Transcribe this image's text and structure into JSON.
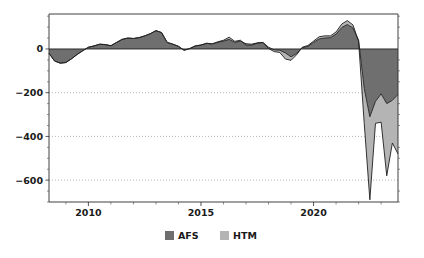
{
  "chart_data": {
    "type": "area",
    "stacked": true,
    "title": "",
    "subtitle": "",
    "xlabel": "",
    "ylabel": "",
    "xlim": [
      2008.25,
      2023.75
    ],
    "ylim": [
      -700,
      160
    ],
    "yticks": [
      0,
      -200,
      -400,
      -600
    ],
    "ytick_labels": [
      "0",
      "−200",
      "−400",
      "−600"
    ],
    "xticks": [
      2010,
      2015,
      2020
    ],
    "xtick_labels": [
      "2010",
      "2015",
      "2020"
    ],
    "xminor_ticks": [
      2009,
      2011,
      2012,
      2013,
      2014,
      2016,
      2017,
      2018,
      2019,
      2021,
      2022,
      2023
    ],
    "grid": "y-dotted",
    "legend_position": "bottom-center",
    "colors": {
      "afs": "#6f6f6f",
      "htm": "#b4b4b4",
      "outline": "#1f1f1f",
      "axis": "#2a2a2a",
      "grid": "#9a9a9a",
      "background": "#ffffff"
    },
    "x": [
      2008.25,
      2008.5,
      2008.75,
      2009.0,
      2009.25,
      2009.5,
      2009.75,
      2010.0,
      2010.25,
      2010.5,
      2010.75,
      2011.0,
      2011.25,
      2011.5,
      2011.75,
      2012.0,
      2012.25,
      2012.5,
      2012.75,
      2013.0,
      2013.25,
      2013.5,
      2013.75,
      2014.0,
      2014.25,
      2014.5,
      2014.75,
      2015.0,
      2015.25,
      2015.5,
      2015.75,
      2016.0,
      2016.25,
      2016.5,
      2016.75,
      2017.0,
      2017.25,
      2017.5,
      2017.75,
      2018.0,
      2018.25,
      2018.5,
      2018.75,
      2019.0,
      2019.25,
      2019.5,
      2019.75,
      2020.0,
      2020.25,
      2020.5,
      2020.75,
      2021.0,
      2021.25,
      2021.5,
      2021.75,
      2022.0,
      2022.25,
      2022.5,
      2022.75,
      2023.0,
      2023.25,
      2023.5,
      2023.75
    ],
    "series": [
      {
        "name": "AFS",
        "key": "afs",
        "color": "#6f6f6f",
        "values": [
          -20,
          -55,
          -65,
          -62,
          -45,
          -25,
          -8,
          8,
          14,
          22,
          20,
          15,
          30,
          44,
          50,
          48,
          52,
          60,
          70,
          84,
          75,
          30,
          22,
          12,
          -6,
          2,
          14,
          18,
          26,
          22,
          30,
          36,
          44,
          30,
          36,
          24,
          22,
          28,
          30,
          8,
          -4,
          -6,
          -18,
          -36,
          -20,
          6,
          12,
          30,
          46,
          50,
          52,
          68,
          98,
          112,
          96,
          40,
          -180,
          -310,
          -240,
          -205,
          -250,
          -235,
          -208
        ]
      },
      {
        "name": "HTM",
        "key": "htm",
        "color": "#b4b4b4",
        "values": [
          0,
          0,
          0,
          0,
          0,
          0,
          0,
          0,
          0,
          0,
          0,
          0,
          0,
          0,
          0,
          0,
          0,
          0,
          0,
          0,
          0,
          0,
          0,
          0,
          0,
          0,
          0,
          0,
          0,
          2,
          3,
          4,
          10,
          5,
          4,
          -6,
          -4,
          -2,
          0,
          -6,
          -8,
          -10,
          -28,
          -16,
          -6,
          2,
          4,
          6,
          10,
          10,
          8,
          10,
          16,
          18,
          14,
          -6,
          -160,
          -380,
          -100,
          -130,
          -330,
          -195,
          -272
        ]
      }
    ],
    "legend": [
      {
        "label": "AFS",
        "color": "#6f6f6f"
      },
      {
        "label": "HTM",
        "color": "#b4b4b4"
      }
    ],
    "annotations": []
  },
  "plot_geometry": {
    "left": 49,
    "right": 398,
    "top": 14,
    "bottom": 202
  }
}
